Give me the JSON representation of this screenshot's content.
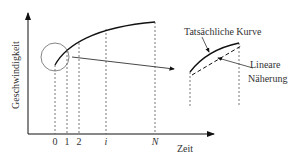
{
  "diagram": {
    "y_axis_label": "Geschwindigkeit",
    "x_axis_label": "Zeit",
    "x_ticks": [
      "0",
      "1",
      "2",
      "i",
      "N"
    ],
    "callouts": {
      "actual_curve": "Tatsächliche Kurve",
      "linear_line1": "Lineare",
      "linear_line2": "Näherung"
    }
  }
}
